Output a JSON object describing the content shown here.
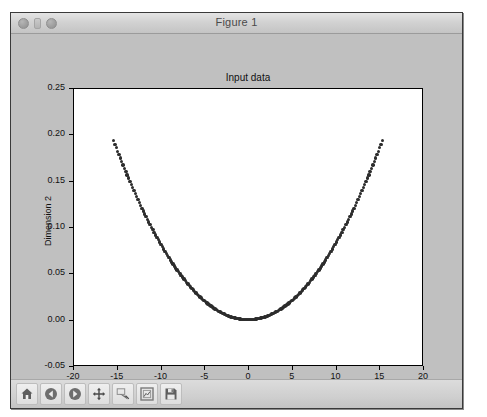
{
  "window": {
    "title": "Figure 1",
    "controls": [
      {
        "name": "close-button",
        "label": "close"
      },
      {
        "name": "minimize-button",
        "label": "minimize"
      },
      {
        "name": "zoom-button",
        "label": "zoom"
      }
    ]
  },
  "toolbar": {
    "buttons": [
      {
        "name": "home-button",
        "icon": "home-icon",
        "tooltip": "Reset original view"
      },
      {
        "name": "back-button",
        "icon": "back-arrow-icon",
        "tooltip": "Back to previous view"
      },
      {
        "name": "forward-button",
        "icon": "forward-arrow-icon",
        "tooltip": "Forward to next view"
      },
      {
        "name": "pan-button",
        "icon": "move-cross-icon",
        "tooltip": "Pan axes with left mouse, zoom with right"
      },
      {
        "name": "zoom-rect-button",
        "icon": "zoom-rectangle-icon",
        "tooltip": "Zoom to rectangle"
      },
      {
        "name": "configure-subplots-button",
        "icon": "subplot-config-icon",
        "tooltip": "Configure subplots"
      },
      {
        "name": "save-button",
        "icon": "floppy-disk-icon",
        "tooltip": "Save the figure"
      }
    ]
  },
  "chart_data": {
    "type": "scatter",
    "title": "Input data",
    "xlabel": "Dimension 1",
    "ylabel": "Dimension 2",
    "xlim": [
      -20,
      20
    ],
    "ylim": [
      -0.05,
      0.25
    ],
    "xticks": [
      -20,
      -15,
      -10,
      -5,
      0,
      5,
      10,
      15,
      20
    ],
    "xticklabels": [
      "-20",
      "-15",
      "-10",
      "-5",
      "0",
      "5",
      "10",
      "15",
      "20"
    ],
    "yticks": [
      -0.05,
      0.0,
      0.05,
      0.1,
      0.15,
      0.2,
      0.25
    ],
    "yticklabels": [
      "-0.05",
      "0.00",
      "0.05",
      "0.10",
      "0.15",
      "0.20",
      "0.25"
    ],
    "grid": false,
    "legend": null,
    "marker": "o",
    "marker_color": "#2c2c2c",
    "marker_size": 3.4,
    "series": [
      {
        "name": "input data",
        "relation": "y = 0.00082 * x^2",
        "x_start": -15.35,
        "x_end": 15.35,
        "n_points": 200,
        "coefficient": 0.00082,
        "y_at_x_min": 0.1932,
        "y_at_x_max": 0.1932,
        "y_at_zero": 0.0
      }
    ]
  }
}
